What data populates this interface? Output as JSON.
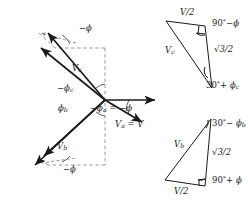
{
  "figure": {
    "type": "phasor-diagram"
  },
  "phasor": {
    "origin": {
      "x": 105,
      "y": 100
    },
    "labels": {
      "vc": "V",
      "vc_sub": "c",
      "vb": "V",
      "vb_sub": "b",
      "va_eq": "V",
      "va_sub": "a",
      "va_eq_tail": " = V",
      "neg_phi_top": "−ϕ",
      "neg_phi_bottom": "−ϕ",
      "neg_phi_c": "−ϕ",
      "neg_phi_c_sub": "c",
      "phi_b": "ϕ",
      "phi_b_sub": "b",
      "neg_phi_a": "−ϕ",
      "neg_phi_a_sub": "a",
      "neg_phi_a_tail": " = −ϕ"
    }
  },
  "triangle_top": {
    "hyp_label": "V",
    "hyp_sub": "c",
    "top_side": "V/2",
    "right_side": "√3/2",
    "angle_top_right": "90",
    "angle_top_right_deg": "°",
    "angle_top_right_tail": "−ϕ",
    "angle_bottom": "30",
    "angle_bottom_deg": "°",
    "angle_bottom_tail": "+ ϕ",
    "angle_bottom_sub": "c"
  },
  "triangle_bottom": {
    "hyp_label": "V",
    "hyp_sub": "b",
    "bottom_side": "V/2",
    "right_side": "√3/2",
    "angle_top": "30",
    "angle_top_deg": "°",
    "angle_top_tail": "− ϕ",
    "angle_top_sub": "b",
    "angle_bottom_right": "90",
    "angle_bottom_right_deg": "°",
    "angle_bottom_right_tail": "+ ϕ"
  },
  "colors": {
    "stroke": "#1a1a1a",
    "dashed": "#9a9a9a",
    "background": "#ffffff"
  }
}
